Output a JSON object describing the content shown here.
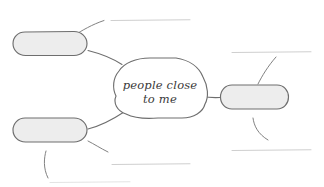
{
  "worksheet": {
    "type": "mind-map",
    "title": "people close to me",
    "background_color": "#ffffff",
    "node_fill_color": "#ededed",
    "node_stroke_color": "#6e6e6e",
    "center_fill_color": "#ffffff",
    "rule_line_color": "#cfcfcf",
    "text_color": "#3a3a3a"
  },
  "center_node": {
    "label_line_1": "people close",
    "label_line_2": "to me",
    "label_full": "people close to me",
    "shape": "cloud-bubble"
  },
  "branch_nodes": [
    {
      "id": "node-top-left",
      "label": "",
      "position": "top-left",
      "shape": "rounded-pill",
      "blank": true
    },
    {
      "id": "node-bottom-left",
      "label": "",
      "position": "bottom-left",
      "shape": "rounded-pill",
      "blank": true
    },
    {
      "id": "node-right",
      "label": "",
      "position": "right",
      "shape": "rounded-pill",
      "blank": true
    }
  ],
  "write_lines": [
    {
      "id": "write-line-top",
      "label": "",
      "position": "top-center",
      "blank": true
    },
    {
      "id": "write-line-right-upper",
      "label": "",
      "position": "right-upper",
      "blank": true
    },
    {
      "id": "write-line-right-lower",
      "label": "",
      "position": "right-lower",
      "blank": true
    },
    {
      "id": "write-line-bottom-center",
      "label": "",
      "position": "bottom-center",
      "blank": true
    },
    {
      "id": "write-line-bottom-left",
      "label": "",
      "position": "bottom-left",
      "blank": true
    }
  ]
}
